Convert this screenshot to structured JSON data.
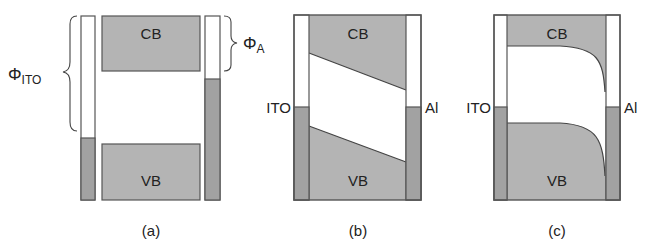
{
  "colors": {
    "band_fill": "#b4b4b4",
    "electrode_fill": "#a2a2a2",
    "outline": "#555555",
    "background": "#ffffff"
  },
  "panels": [
    {
      "id": "a",
      "caption": "(a)",
      "cb_label": "CB",
      "vb_label": "VB",
      "left_workfunction_symbol": "Φ",
      "left_workfunction_subscript": "ITO",
      "right_workfunction_symbol": "Φ",
      "right_workfunction_subscript": "A"
    },
    {
      "id": "b",
      "caption": "(b)",
      "cb_label": "CB",
      "vb_label": "VB",
      "left_electrode_label": "ITO",
      "right_electrode_label": "Al"
    },
    {
      "id": "c",
      "caption": "(c)",
      "cb_label": "CB",
      "vb_label": "VB",
      "left_electrode_label": "ITO",
      "right_electrode_label": "Al"
    }
  ]
}
